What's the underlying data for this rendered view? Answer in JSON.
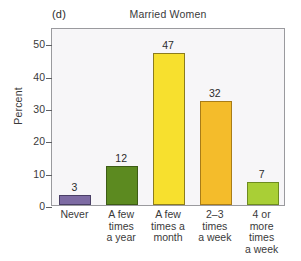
{
  "figure": {
    "panel_label": "(d)",
    "title": "Married Women"
  },
  "chart_data": {
    "type": "bar",
    "title": "Married Women",
    "panel": "(d)",
    "xlabel": "",
    "ylabel": "Percent",
    "ylim": [
      0,
      55
    ],
    "yticks": [
      0,
      10,
      20,
      30,
      40,
      50
    ],
    "ytick_labels": [
      "0",
      "10",
      "20",
      "30",
      "40",
      "50"
    ],
    "grid": false,
    "legend": "none",
    "categories": [
      "Never",
      "A few\ntimes\na year",
      "A few\ntimes a\nmonth",
      "2–3\ntimes\na week",
      "4 or more\ntimes\na week"
    ],
    "values": [
      3,
      12,
      47,
      32,
      7
    ],
    "value_labels": [
      "3",
      "12",
      "47",
      "32",
      "7"
    ],
    "bar_colors": [
      "#7d6ba3",
      "#5c8a20",
      "#f7e02e",
      "#f4bc2b",
      "#a9cf36"
    ],
    "bar_edge_colors": [
      "#4a3f66",
      "#3d5c15",
      "#8c7c1e",
      "#a87c18",
      "#6e8c20"
    ],
    "plot_background": "#f7f6f8",
    "frame_color": "#9a9a9e"
  }
}
